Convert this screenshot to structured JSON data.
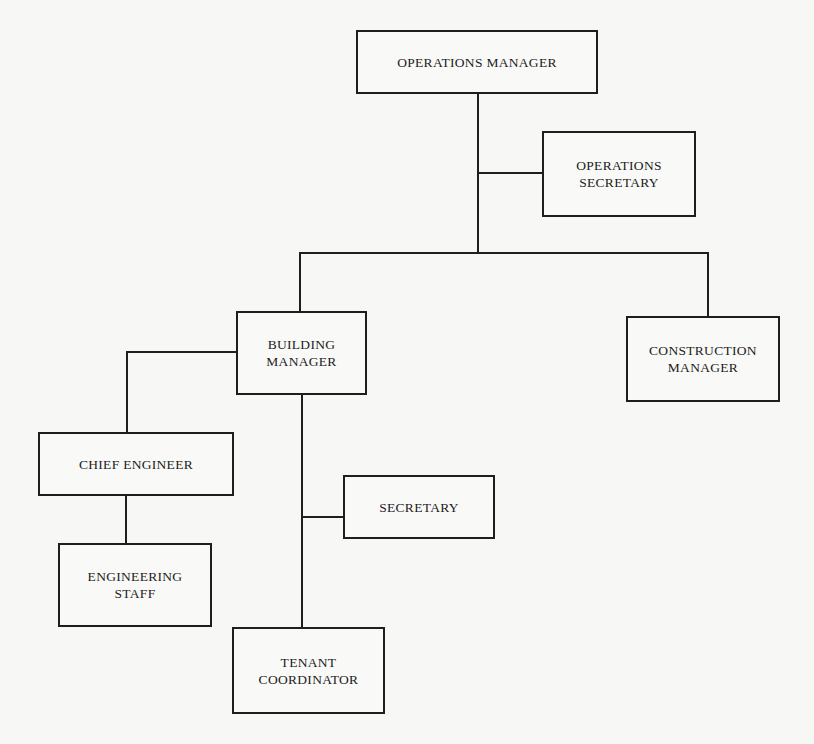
{
  "chart": {
    "type": "org-chart",
    "nodes": [
      {
        "id": "ops_manager",
        "label": "OPERATIONS MANAGER"
      },
      {
        "id": "ops_secretary",
        "label": "OPERATIONS\nSECRETARY"
      },
      {
        "id": "building_manager",
        "label": "BUILDING\nMANAGER"
      },
      {
        "id": "construction_manager",
        "label": "CONSTRUCTION\nMANAGER"
      },
      {
        "id": "chief_engineer",
        "label": "CHIEF ENGINEER"
      },
      {
        "id": "engineering_staff",
        "label": "ENGINEERING\nSTAFF"
      },
      {
        "id": "secretary",
        "label": "SECRETARY"
      },
      {
        "id": "tenant_coordinator",
        "label": "TENANT\nCOORDINATOR"
      }
    ],
    "edges": [
      [
        "ops_manager",
        "ops_secretary"
      ],
      [
        "ops_manager",
        "building_manager"
      ],
      [
        "ops_manager",
        "construction_manager"
      ],
      [
        "building_manager",
        "chief_engineer"
      ],
      [
        "chief_engineer",
        "engineering_staff"
      ],
      [
        "building_manager",
        "secretary"
      ],
      [
        "building_manager",
        "tenant_coordinator"
      ]
    ]
  }
}
